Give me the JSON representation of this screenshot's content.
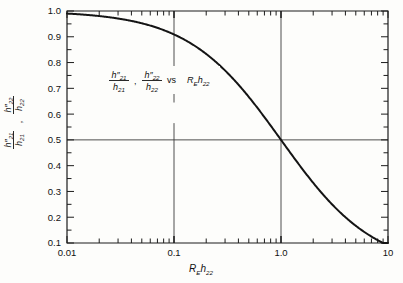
{
  "figure": {
    "background_color": "#fdfdfb",
    "curve_color": "#141414",
    "axis_color": "#1c1c1c",
    "grid_color": "#3a3a3a"
  },
  "axes": {
    "x": {
      "label": "R_E h22",
      "label_parts": {
        "r": "R",
        "sub_e": "E",
        "h": "h",
        "sub_h": "22"
      },
      "scale": "log",
      "min": 0.01,
      "max": 10,
      "tick_labels": [
        "0.01",
        "0.1",
        "1.0",
        "10"
      ],
      "tick_values": [
        0.01,
        0.1,
        1.0,
        10
      ]
    },
    "y": {
      "label": "h''21/h21 , h''22/h22",
      "scale": "linear",
      "min": 0.1,
      "max": 1.0,
      "tick_labels": [
        "1.0",
        "0.9",
        "0.8",
        "0.7",
        "0.6",
        "0.5",
        "0.4",
        "0.3",
        "0.2",
        "0.1"
      ],
      "tick_values": [
        1.0,
        0.9,
        0.8,
        0.7,
        0.6,
        0.5,
        0.4,
        0.3,
        0.2,
        0.1
      ]
    }
  },
  "annotation": {
    "num1": "h″",
    "num1_sub": "21",
    "den1": "h",
    "den1_sub": "21",
    "comma": ",",
    "num2": "h″",
    "num2_sub": "22",
    "den2": "h",
    "den2_sub": "22",
    "vs": "vs",
    "rhs_r": "R",
    "rhs_r_sub": "E",
    "rhs_h": "h",
    "rhs_h_sub": "22"
  },
  "gridlines": {
    "vertical": [
      0.1,
      1.0
    ],
    "horizontal": [
      0.5
    ]
  },
  "chart_data": {
    "type": "line",
    "title": "",
    "xlabel": "R_E h22",
    "ylabel": "h''21/h21 , h''22/h22",
    "xscale": "log",
    "xlim": [
      0.01,
      10
    ],
    "ylim": [
      0.1,
      1.0
    ],
    "grid": true,
    "legend": null,
    "annotations": [
      "h''21/h21 , h''22/h22  vs  R_E h22"
    ],
    "series": [
      {
        "name": "h''/h ratio",
        "formula": "y = 1 / (1 + R_E*h22)",
        "x": [
          0.01,
          0.0158,
          0.0251,
          0.0398,
          0.0631,
          0.1,
          0.1585,
          0.2512,
          0.3981,
          0.631,
          1.0,
          1.585,
          2.512,
          3.981,
          6.31,
          10.0
        ],
        "y": [
          0.99,
          0.984,
          0.976,
          0.962,
          0.941,
          0.909,
          0.863,
          0.799,
          0.715,
          0.613,
          0.5,
          0.387,
          0.285,
          0.201,
          0.137,
          0.091
        ]
      }
    ],
    "key_points": [
      {
        "x": 0.01,
        "y": 0.99
      },
      {
        "x": 0.1,
        "y": 0.909
      },
      {
        "x": 1.0,
        "y": 0.5
      },
      {
        "x": 10.0,
        "y": 0.091
      }
    ]
  }
}
